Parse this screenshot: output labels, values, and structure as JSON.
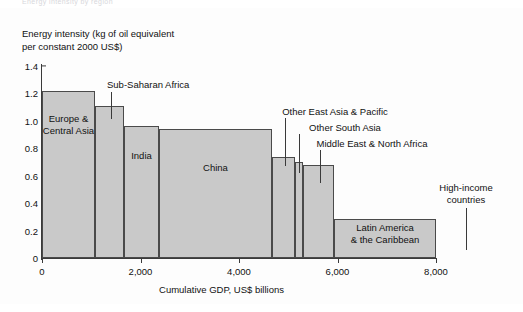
{
  "top_fragment": "Energy intensity by region",
  "chart_data": {
    "type": "bar",
    "title": "",
    "xlabel": "Cumulative GDP, US$ billions",
    "ylabel_line1": "Energy intensity (kg of oil equivalent",
    "ylabel_line2": "per constant 2000 US$)",
    "xlim": [
      0,
      8000
    ],
    "ylim": [
      0,
      1.4
    ],
    "xticks": [
      0,
      2000,
      4000,
      6000,
      8000
    ],
    "xtick_labels": [
      "0",
      "2,000",
      "4,000",
      "6,000",
      "8,000"
    ],
    "yticks": [
      0,
      0.2,
      0.4,
      0.6,
      0.8,
      1.0,
      1.2,
      1.4
    ],
    "ytick_labels": [
      "0",
      "0.2",
      "0.4",
      "0.6",
      "0.8",
      "1.0",
      "1.2",
      "1.4"
    ],
    "grid": false,
    "legend": "none",
    "bar_fill": "#c9c9c9",
    "bar_stroke": "#4a4a4a",
    "note": "Width of each bar is cumulative GDP share; height is energy intensity",
    "bars": [
      {
        "label": "Europe &\nCentral Asia",
        "label_line1": "Europe &",
        "label_line2": "Central Asia",
        "x_start": 0,
        "x_end": 1075,
        "value": 1.22,
        "label_style": "inside"
      },
      {
        "label": "Sub-Saharan Africa",
        "label_line1": "Sub-Saharan Africa",
        "label_line2": "",
        "x_start": 1075,
        "x_end": 1665,
        "value": 1.11,
        "label_style": "callout"
      },
      {
        "label": "India",
        "label_line1": "India",
        "label_line2": "",
        "x_start": 1665,
        "x_end": 2375,
        "value": 0.965,
        "label_style": "inside"
      },
      {
        "label": "China",
        "label_line1": "China",
        "label_line2": "",
        "x_start": 2375,
        "x_end": 4670,
        "value": 0.94,
        "label_style": "inside"
      },
      {
        "label": "Other East Asia & Pacific",
        "label_line1": "Other East Asia & Pacific",
        "label_line2": "",
        "x_start": 4670,
        "x_end": 5140,
        "value": 0.735,
        "label_style": "callout"
      },
      {
        "label": "Other South Asia",
        "label_line1": "Other South Asia",
        "label_line2": "",
        "x_start": 5140,
        "x_end": 5300,
        "value": 0.7,
        "label_style": "callout"
      },
      {
        "label": "Middle East & North Africa",
        "label_line1": "Middle East & North Africa",
        "label_line2": "",
        "x_start": 5300,
        "x_end": 5930,
        "value": 0.675,
        "label_style": "callout"
      },
      {
        "label": "Latin America & the Caribbean",
        "label_line1": "Latin America",
        "label_line2": "& the Caribbean",
        "x_start": 5930,
        "x_end": 8000,
        "value": 0.285,
        "label_style": "inside"
      },
      {
        "label": "High-income countries",
        "label_line1": "High-income",
        "label_line2": "countries",
        "x_start": 5930,
        "x_end": 8000,
        "value": 0.285,
        "label_style": "callout-overlap"
      }
    ]
  }
}
